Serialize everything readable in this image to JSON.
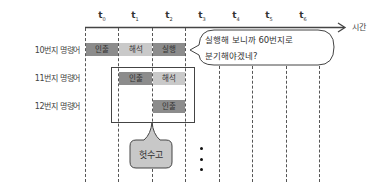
{
  "diagram": {
    "time_axis": {
      "labels": [
        {
          "base": "t",
          "sub": "0"
        },
        {
          "base": "t",
          "sub": "1"
        },
        {
          "base": "t",
          "sub": "2"
        },
        {
          "base": "t",
          "sub": "3"
        },
        {
          "base": "t",
          "sub": "4"
        },
        {
          "base": "t",
          "sub": "5"
        },
        {
          "base": "t",
          "sub": "6"
        }
      ],
      "axis_label": "시간"
    },
    "rows": [
      {
        "label": "10번지 명령어",
        "stages": [
          "인출",
          "해석",
          "실행"
        ]
      },
      {
        "label": "11번지 명령어",
        "stages": [
          "인출",
          "해석"
        ]
      },
      {
        "label": "12번지 명령어",
        "stages": [
          "인출"
        ]
      }
    ],
    "speech_bubble": {
      "line1": "실행해 보니까 60번지로",
      "line2": "분기해야겠네?"
    },
    "wasted_bubble": {
      "text": "헛수고"
    },
    "colors": {
      "fetch": "#8c8c8c",
      "decode": "#c9c9c9",
      "execute": "#8c8c8c",
      "bubble_fill": "#c8c8c8",
      "line": "#555555"
    }
  }
}
